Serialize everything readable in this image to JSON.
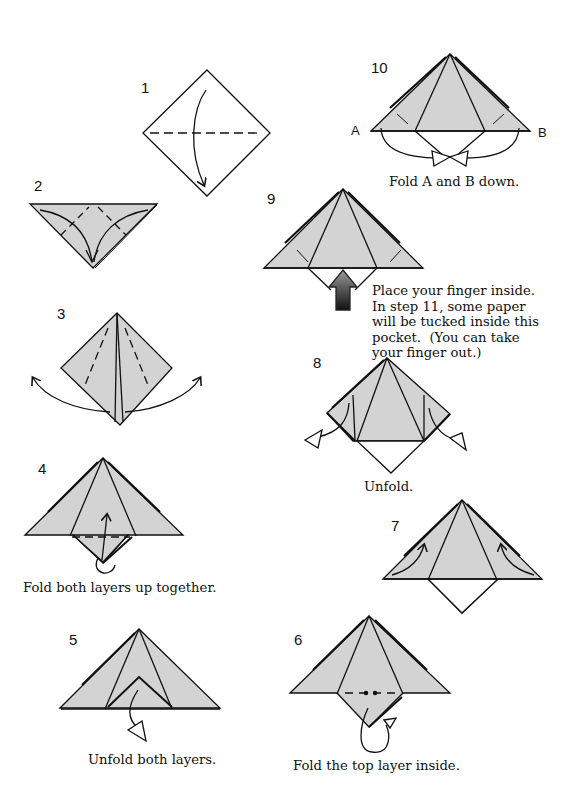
{
  "diagram": {
    "type": "origami-folding-instructions",
    "colors": {
      "paper": "#d3d3d3",
      "line": "#111111",
      "background": "#ffffff",
      "arrow_dark": "#1a1a1a"
    },
    "steps": [
      {
        "number": "1",
        "caption": ""
      },
      {
        "number": "2",
        "caption": ""
      },
      {
        "number": "3",
        "caption": ""
      },
      {
        "number": "4",
        "caption": "Fold both layers up together."
      },
      {
        "number": "5",
        "caption": "Unfold both layers."
      },
      {
        "number": "6",
        "caption": "Fold the top layer inside."
      },
      {
        "number": "7",
        "caption": ""
      },
      {
        "number": "8",
        "caption": "Unfold."
      },
      {
        "number": "9",
        "caption_lines": [
          "Place your finger inside.",
          "In step 11, some paper",
          "will be tucked inside this",
          "pocket.  (You can take",
          "your finger out.)"
        ]
      },
      {
        "number": "10",
        "caption": "Fold A and B down.",
        "point_labels": [
          "A",
          "B"
        ]
      }
    ]
  }
}
